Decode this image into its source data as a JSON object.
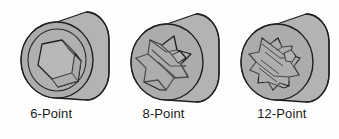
{
  "figure": {
    "background_color": "#fefefe",
    "body_fill": "#b3b3b3",
    "face_fill": "#aaaaaa",
    "recess_fill": "#b8b8b8",
    "outline_color": "#1f1f1f",
    "label_color": "#1b1b1b"
  },
  "sockets": [
    {
      "id": "socket-6-point",
      "label": "6-Point",
      "points": 6,
      "drive_shape": "hexagon",
      "center": {
        "x": 57,
        "y": 60
      },
      "face_radius": 36
    },
    {
      "id": "socket-8-point",
      "label": "8-Point",
      "points": 8,
      "drive_shape": "double-square",
      "center": {
        "x": 167,
        "y": 62
      },
      "face_radius": 36
    },
    {
      "id": "socket-12-point",
      "label": "12-Point",
      "points": 12,
      "drive_shape": "double-hexagon",
      "center": {
        "x": 277,
        "y": 62
      },
      "face_radius": 36
    }
  ],
  "captions": {
    "first": "6-Point",
    "second": "8-Point",
    "third": "12-Point"
  }
}
